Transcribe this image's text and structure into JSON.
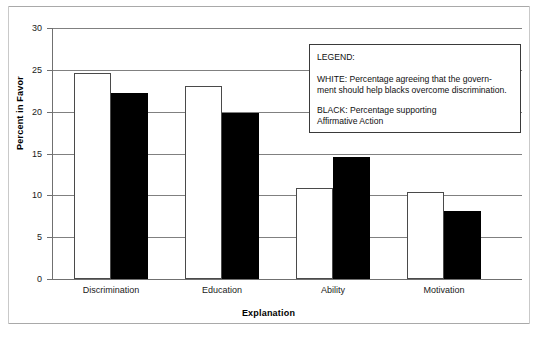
{
  "chart_data": {
    "type": "bar",
    "title": "",
    "xlabel": "Explanation",
    "ylabel": "Percent in Favor",
    "ylim": [
      0,
      30
    ],
    "ytick_step": 5,
    "yticks": [
      0,
      5,
      10,
      15,
      20,
      25,
      30
    ],
    "ytick_labels": [
      "0",
      "5",
      "10",
      "15",
      "20",
      "25",
      "30"
    ],
    "grid": true,
    "grid_axis": "y",
    "legend_position": "inside-top-right",
    "categories": [
      "Discrimination",
      "Education",
      "Ability",
      "Motivation"
    ],
    "series": [
      {
        "name": "WHITE",
        "label": "Percentage agreeing that the government should help blacks overcome discrimination.",
        "color": "#ffffff",
        "edge_color": "#4a4a4a",
        "values": [
          24.6,
          23.1,
          10.9,
          10.4
        ]
      },
      {
        "name": "BLACK",
        "label": "Percentage supporting Affirmative Action",
        "color": "#000000",
        "edge_color": "#000000",
        "values": [
          22.2,
          19.8,
          14.6,
          8.1
        ]
      }
    ]
  },
  "legend": {
    "title": "LEGEND:",
    "white_line1": "WHITE: Percentage agreeing that the govern-",
    "white_line2": "ment should help blacks overcome discrimination.",
    "black_line1": "BLACK:  Percentage supporting",
    "black_line2": "Affirmative Action"
  },
  "axes": {
    "y_title": "Percent in Favor",
    "x_title": "Explanation",
    "ytick_0": "0",
    "ytick_1": "5",
    "ytick_2": "10",
    "ytick_3": "15",
    "ytick_4": "20",
    "ytick_5": "25",
    "ytick_6": "30",
    "cat_0": "Discrimination",
    "cat_1": "Education",
    "cat_2": "Ability",
    "cat_3": "Motivation"
  }
}
